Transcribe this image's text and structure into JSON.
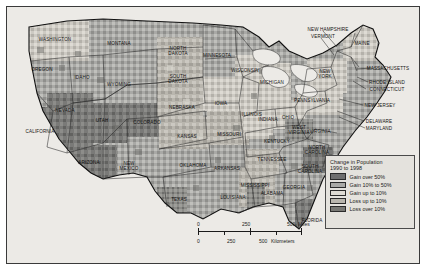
{
  "map": {
    "title": "United States population change choropleth map",
    "projection_note": "contiguous United States",
    "legend": {
      "title_line1": "Change in Population",
      "title_line2": "1990 to 1998",
      "entries": [
        {
          "label": "Gain over 50%",
          "color": "#6e6e6e",
          "key": "gain-over-50"
        },
        {
          "label": "Gain 10% to 50%",
          "color": "#a9a9a6",
          "key": "gain-10-to-50"
        },
        {
          "label": "Gain up to 10%",
          "color": "#dedbd4",
          "key": "gain-up-to-10"
        },
        {
          "label": "Loss up to 10%",
          "color": "#b9b6ae",
          "key": "loss-up-to-10"
        },
        {
          "label": "Loss over 10%",
          "color": "#787874",
          "key": "loss-over-10"
        }
      ]
    },
    "scale": {
      "miles": {
        "ticks": [
          "0",
          "250",
          "500"
        ],
        "unit": "Miles"
      },
      "kilometers": {
        "ticks": [
          "0",
          "250",
          "500"
        ],
        "unit": "Kilometers"
      }
    },
    "states": [
      {
        "name": "WASHINGTON",
        "x": 48,
        "y": 32,
        "dark": false
      },
      {
        "name": "OREGON",
        "x": 35,
        "y": 62,
        "dark": false
      },
      {
        "name": "IDAHO",
        "x": 75,
        "y": 70,
        "dark": false
      },
      {
        "name": "MONTANA",
        "x": 112,
        "y": 36,
        "dark": false
      },
      {
        "name": "WYOMING",
        "x": 112,
        "y": 77,
        "dark": false
      },
      {
        "name": "NEVADA",
        "x": 58,
        "y": 103,
        "dark": false
      },
      {
        "name": "UTAH",
        "x": 95,
        "y": 113,
        "dark": false
      },
      {
        "name": "CALIFORNIA",
        "x": 33,
        "y": 124,
        "dark": false
      },
      {
        "name": "ARIZONA",
        "x": 82,
        "y": 155,
        "dark": false
      },
      {
        "name": "NEW\nMEXICO",
        "x": 122,
        "y": 160,
        "dark": false
      },
      {
        "name": "COLORADO",
        "x": 140,
        "y": 115,
        "dark": false
      },
      {
        "name": "NORTH\nDAKOTA",
        "x": 171,
        "y": 45,
        "dark": false
      },
      {
        "name": "SOUTH\nDAKOTA",
        "x": 171,
        "y": 73,
        "dark": false
      },
      {
        "name": "NEBRASKA",
        "x": 175,
        "y": 100,
        "dark": false
      },
      {
        "name": "KANSAS",
        "x": 180,
        "y": 129,
        "dark": false
      },
      {
        "name": "OKLAHOMA",
        "x": 186,
        "y": 158,
        "dark": false
      },
      {
        "name": "TEXAS",
        "x": 172,
        "y": 192,
        "dark": false
      },
      {
        "name": "MINNESOTA",
        "x": 210,
        "y": 48,
        "dark": false
      },
      {
        "name": "IOWA",
        "x": 214,
        "y": 96,
        "dark": false
      },
      {
        "name": "MISSOURI",
        "x": 222,
        "y": 127,
        "dark": false
      },
      {
        "name": "ARKANSAS",
        "x": 220,
        "y": 161,
        "dark": false
      },
      {
        "name": "LOUISIANA",
        "x": 226,
        "y": 190,
        "dark": false
      },
      {
        "name": "WISCONSIN",
        "x": 238,
        "y": 63,
        "dark": false
      },
      {
        "name": "ILLINOIS",
        "x": 245,
        "y": 107,
        "dark": false
      },
      {
        "name": "MISSISSIPPI",
        "x": 248,
        "y": 178,
        "dark": false
      },
      {
        "name": "ALABAMA",
        "x": 265,
        "y": 186,
        "dark": false
      },
      {
        "name": "MICHIGAN",
        "x": 265,
        "y": 75,
        "dark": false
      },
      {
        "name": "INDIANA",
        "x": 261,
        "y": 112,
        "dark": false
      },
      {
        "name": "OHIO",
        "x": 281,
        "y": 110,
        "dark": false
      },
      {
        "name": "KENTUCKY",
        "x": 270,
        "y": 134,
        "dark": false
      },
      {
        "name": "TENNESSEE",
        "x": 265,
        "y": 152,
        "dark": false
      },
      {
        "name": "GEORGIA",
        "x": 287,
        "y": 180,
        "dark": false
      },
      {
        "name": "FLORIDA",
        "x": 305,
        "y": 213,
        "dark": false
      },
      {
        "name": "SOUTH\nCAROLINA",
        "x": 303,
        "y": 163,
        "dark": false
      },
      {
        "name": "NORTH\nCAROLINA",
        "x": 310,
        "y": 144,
        "dark": false
      },
      {
        "name": "WEST\nVIRGINIA",
        "x": 292,
        "y": 124,
        "dark": false
      },
      {
        "name": "VIRGINIA",
        "x": 313,
        "y": 124,
        "dark": false
      },
      {
        "name": "PENNSYLVANIA",
        "x": 305,
        "y": 93,
        "dark": false
      },
      {
        "name": "NEW\nYORK",
        "x": 318,
        "y": 68,
        "dark": false
      },
      {
        "name": "MAINE",
        "x": 355,
        "y": 36,
        "dark": false
      }
    ],
    "callouts": [
      {
        "name": "NEW HAMPSHIRE",
        "x": 321,
        "y": 22
      },
      {
        "name": "VERMONT",
        "x": 316,
        "y": 29
      },
      {
        "name": "MASSACHUSETTS",
        "x": 381,
        "y": 61
      },
      {
        "name": "RHODE ISLAND",
        "x": 380,
        "y": 75
      },
      {
        "name": "CONNECTICUT",
        "x": 380,
        "y": 82
      },
      {
        "name": "NEW JERSEY",
        "x": 373,
        "y": 98
      },
      {
        "name": "DELAWARE",
        "x": 372,
        "y": 114
      },
      {
        "name": "MARYLAND",
        "x": 372,
        "y": 121
      }
    ]
  }
}
